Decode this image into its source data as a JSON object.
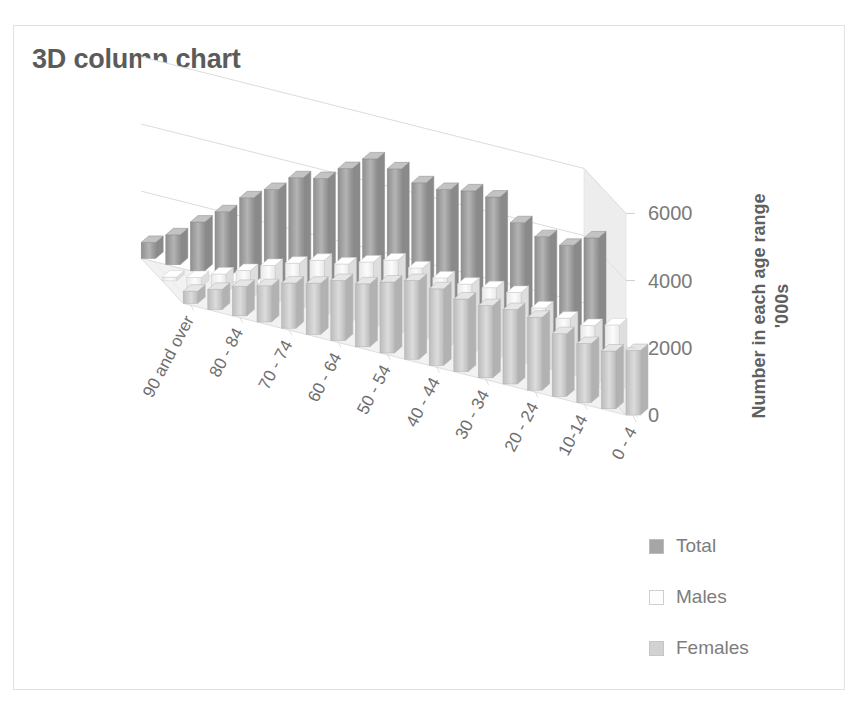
{
  "title": "3D column chart",
  "y_axis_title_line1": "Number in each age range",
  "y_axis_title_line2": "'000s",
  "legend": [
    {
      "label": "Total",
      "swatch": "legend-swatch-total",
      "color": "#a6a6a6"
    },
    {
      "label": "Males",
      "swatch": "legend-swatch-males",
      "color": "#fdfdfd"
    },
    {
      "label": "Females",
      "swatch": "legend-swatch-females",
      "color": "#d2d2d2"
    }
  ],
  "colors": {
    "total": "#a0a0a0",
    "males": "#f7f7f7",
    "females": "#c9c9c9",
    "floor": "#f2f2f2",
    "wall": "#ededed",
    "gridline": "#dcdcdc",
    "text": "#7a7a7a",
    "title": "#5b5b5b",
    "border": "#e2e2e2"
  },
  "chart_data": {
    "type": "bar",
    "subtype": "3d-column",
    "title": "3D column chart",
    "xlabel": "",
    "ylabel": "Number in each age range '000s",
    "ylim": [
      0,
      6000
    ],
    "yticks": [
      0,
      2000,
      4000,
      6000
    ],
    "ytick_labels": [
      "0",
      "2000",
      "4000",
      "6000"
    ],
    "grid": true,
    "legend_position": "bottom-right",
    "categories": [
      "90 and over",
      "85 - 89",
      "80 - 84",
      "75 - 79",
      "70 - 74",
      "65 - 69",
      "60 - 64",
      "55 - 59",
      "50 - 54",
      "45 - 49",
      "40 - 44",
      "35 - 39",
      "30 - 34",
      "25 - 29",
      "20 - 24",
      "15 - 19",
      "10-14",
      "5 - 9",
      "0 - 4"
    ],
    "visible_category_labels": [
      "90 and over",
      "80 - 84",
      "70 - 74",
      "60 - 64",
      "50 - 54",
      "40 - 44",
      "30 - 34",
      "20 - 24",
      "10-14",
      "0 - 4"
    ],
    "series": [
      {
        "name": "Total",
        "values": [
          476,
          887,
          1449,
          1942,
          2542,
          2974,
          3508,
          3670,
          4151,
          4622,
          4510,
          4280,
          4267,
          4409,
          4409,
          3830,
          3600,
          3526,
          3930
        ]
      },
      {
        "name": "Males",
        "values": [
          113,
          284,
          574,
          862,
          1197,
          1451,
          1721,
          1795,
          2039,
          2282,
          2231,
          2119,
          2118,
          2194,
          2238,
          1963,
          1843,
          1806,
          2012
        ]
      },
      {
        "name": "Females",
        "values": [
          363,
          603,
          875,
          1080,
          1345,
          1523,
          1787,
          1875,
          2112,
          2340,
          2279,
          2161,
          2149,
          2215,
          2171,
          1867,
          1757,
          1720,
          1918
        ]
      }
    ]
  }
}
